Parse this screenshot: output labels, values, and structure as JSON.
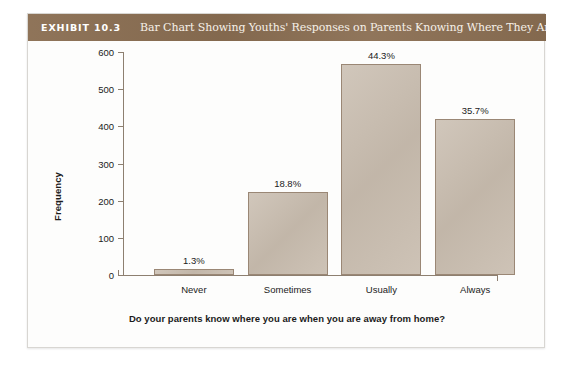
{
  "exhibit": {
    "tag": "EXHIBIT 10.3",
    "title": "Bar Chart Showing Youths' Responses on Parents Knowing Where They Are",
    "header_color": "#8a6e52",
    "bar_fill_color": "#c8bcae",
    "bar_border_color": "#9a8775",
    "axis_color": "#8d7f70"
  },
  "chart_data": {
    "type": "bar",
    "title": "Bar Chart Showing Youths' Responses on Parents Knowing Where They Are",
    "xlabel": "Do your parents know where you are when you are away from home?",
    "ylabel": "Frequency",
    "categories": [
      "Never",
      "Sometimes",
      "Usually",
      "Always"
    ],
    "values": [
      17,
      222,
      567,
      419
    ],
    "data_labels": [
      "1.3%",
      "18.8%",
      "44.3%",
      "35.7%"
    ],
    "percentages": [
      1.3,
      18.8,
      44.3,
      35.7
    ],
    "ylim": [
      0,
      600
    ],
    "yticks": [
      0,
      100,
      200,
      300,
      400,
      500,
      600
    ],
    "ytick_labels": [
      "0",
      "100",
      "200",
      "300",
      "400",
      "500",
      "600"
    ],
    "grid": false,
    "legend": false
  }
}
